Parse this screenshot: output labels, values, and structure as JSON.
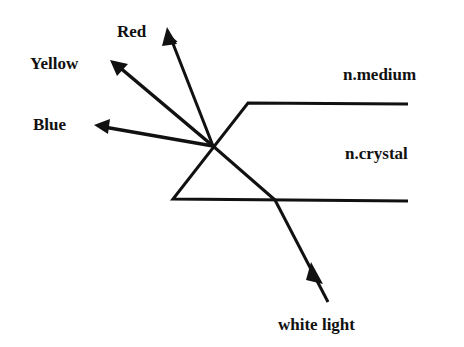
{
  "diagram": {
    "labels": {
      "red": "Red",
      "yellow": "Yellow",
      "blue": "Blue",
      "medium": "n.medium",
      "crystal": "n.crystal",
      "source": "white light"
    },
    "colors": {
      "stroke": "#111111",
      "background": "#ffffff"
    }
  }
}
